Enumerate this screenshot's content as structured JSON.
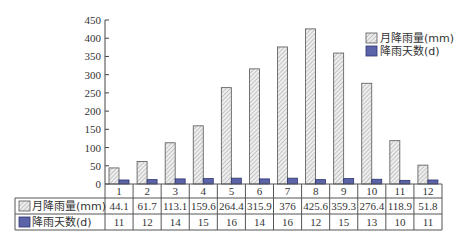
{
  "chart_data": {
    "type": "bar",
    "title": "",
    "xlabel": "",
    "ylabel": "",
    "ylim": [
      0,
      450
    ],
    "yticks": [
      0,
      50,
      100,
      150,
      200,
      250,
      300,
      350,
      400,
      450
    ],
    "grid": false,
    "legend_position": "top-right",
    "categories": [
      "1",
      "2",
      "3",
      "4",
      "5",
      "6",
      "7",
      "8",
      "9",
      "10",
      "11",
      "12"
    ],
    "series": [
      {
        "name": "月降雨量(mm)",
        "pattern": "hatched",
        "color": "#e6e6e6",
        "values": [
          44.1,
          61.7,
          113.1,
          159.6,
          264.4,
          315.9,
          376,
          425.6,
          359.3,
          276.4,
          118.9,
          51.8
        ],
        "labels": [
          "44.1",
          "61.7",
          "113.1",
          "159.6",
          "264.4",
          "315.9",
          "376",
          "425.6",
          "359.3",
          "276.4",
          "118.9",
          "51.8"
        ]
      },
      {
        "name": "降雨天数(d)",
        "pattern": "solid",
        "color": "#5b64a8",
        "values": [
          11,
          12,
          14,
          15,
          16,
          14,
          16,
          12,
          15,
          13,
          10,
          11
        ],
        "labels": [
          "11",
          "12",
          "14",
          "15",
          "16",
          "14",
          "16",
          "12",
          "15",
          "13",
          "10",
          "11"
        ]
      }
    ],
    "data_table": true
  }
}
